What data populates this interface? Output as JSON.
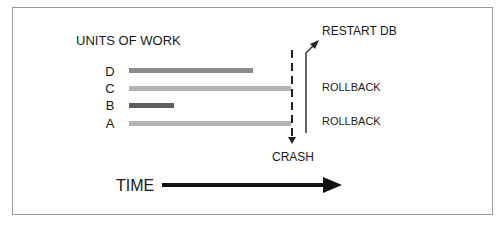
{
  "diagram": {
    "title": "UNITS OF WORK",
    "units": [
      {
        "label": "D",
        "color": "#8c8c8c",
        "start_x": 129,
        "end_x": 253,
        "y": 68
      },
      {
        "label": "C",
        "color": "#b3b3b3",
        "start_x": 129,
        "end_x": 291,
        "y": 86
      },
      {
        "label": "B",
        "color": "#5e5e5e",
        "start_x": 129,
        "end_x": 174,
        "y": 103
      },
      {
        "label": "A",
        "color": "#b3b3b3",
        "start_x": 129,
        "end_x": 291,
        "y": 121
      }
    ],
    "events": {
      "crash": "CRASH",
      "restart": "RESTART DB",
      "rollback_c": "ROLLBACK",
      "rollback_a": "ROLLBACK"
    },
    "time_axis": {
      "label": "TIME"
    }
  }
}
